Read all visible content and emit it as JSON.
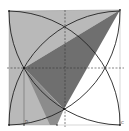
{
  "diagram": {
    "type": "geometry-figure",
    "colors": {
      "background": "#ffffff",
      "light_shade": "#b9b9b9",
      "dark_shade": "#6f6f6f",
      "line": "#222222",
      "dashed": "#333333"
    },
    "labels": {
      "bottom_left": "",
      "bottom_mid": "D",
      "bottom_point": "",
      "bottom_right": "C"
    }
  }
}
